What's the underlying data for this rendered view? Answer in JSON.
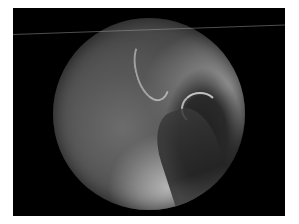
{
  "image": {
    "description": "Grayscale endoscopic view within a circular field of view on black background, framed by white margin",
    "colors": {
      "background": "#ffffff",
      "frame": "#000000",
      "tissue_mid": "#5a5a5a",
      "tissue_light": "#b5b5b5"
    }
  }
}
